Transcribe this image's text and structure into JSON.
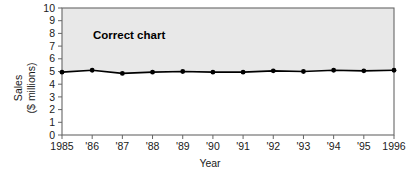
{
  "chart_data": {
    "type": "line",
    "title": "",
    "annotation": "Correct chart",
    "xlabel": "Year",
    "ylabel_line1": "Sales",
    "ylabel_line2": "($ millions)",
    "categories": [
      "1985",
      "'86",
      "'87",
      "'88",
      "'89",
      "'90",
      "'91",
      "'92",
      "'93",
      "'94",
      "'95",
      "1996"
    ],
    "values": [
      4.95,
      5.1,
      4.85,
      4.95,
      5.0,
      4.95,
      4.95,
      5.05,
      5.0,
      5.1,
      5.05,
      5.1
    ],
    "ylim": [
      0,
      10
    ],
    "ytick_labels": [
      "0",
      "1",
      "2",
      "3",
      "4",
      "5",
      "6",
      "7",
      "8",
      "9",
      "10"
    ],
    "yticks": [
      0,
      1,
      2,
      3,
      4,
      5,
      6,
      7,
      8,
      9,
      10
    ],
    "grid": false,
    "legend": "none",
    "marker": "filled-circle",
    "line_color": "#000000",
    "fill_above_color": "#e8e8e8",
    "plot_background": "#ffffff",
    "frame_color": "#555555"
  }
}
